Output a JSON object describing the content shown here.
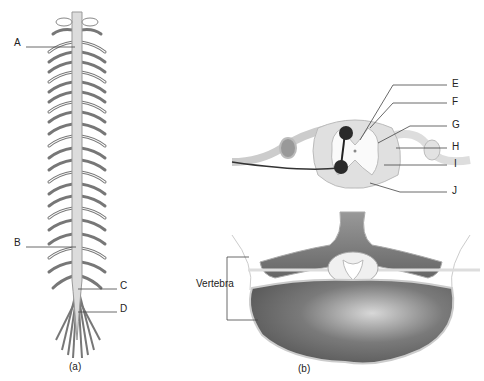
{
  "figure_a": {
    "caption": "(a)",
    "labels": [
      {
        "id": "A",
        "text": "A"
      },
      {
        "id": "B",
        "text": "B"
      },
      {
        "id": "C",
        "text": "C"
      },
      {
        "id": "D",
        "text": "D"
      }
    ]
  },
  "figure_b": {
    "caption": "(b)",
    "labels": [
      {
        "id": "E",
        "text": "E"
      },
      {
        "id": "F",
        "text": "F"
      },
      {
        "id": "G",
        "text": "G"
      },
      {
        "id": "H",
        "text": "H"
      },
      {
        "id": "I",
        "text": "I"
      },
      {
        "id": "J",
        "text": "J"
      }
    ],
    "vertebra_label": "Vertebra"
  },
  "colors": {
    "cord": "#d9d9d9",
    "outline": "#888888",
    "bone_dark": "#6f6f6f",
    "neuron": "#222222"
  }
}
